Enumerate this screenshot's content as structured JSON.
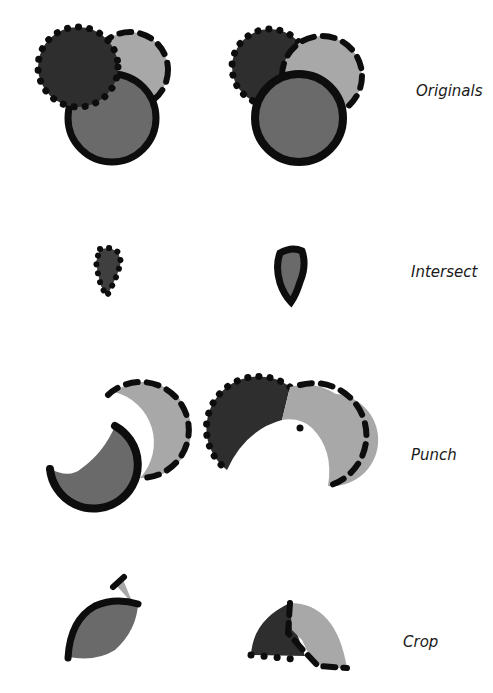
{
  "rows": [
    {
      "label": "Originals",
      "name": "originals"
    },
    {
      "label": "Intersect",
      "name": "intersect"
    },
    {
      "label": "Punch",
      "name": "punch"
    },
    {
      "label": "Crop",
      "name": "crop"
    }
  ],
  "colors": {
    "dark_fill": "#2e2e2e",
    "medium_fill": "#6a6a6a",
    "light_fill": "#a8a8a8",
    "stroke": "#0d0d0d",
    "background": "#ffffff"
  }
}
